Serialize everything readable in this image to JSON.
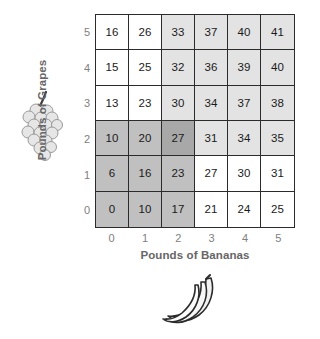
{
  "chart_data": {
    "type": "heatmap",
    "title": "",
    "xlabel": "Pounds of Bananas",
    "ylabel": "Pounds of Grapes",
    "x_ticks": [
      "0",
      "1",
      "2",
      "3",
      "4",
      "5"
    ],
    "y_ticks": [
      "5",
      "4",
      "3",
      "2",
      "1",
      "0"
    ],
    "x_values": [
      0,
      1,
      2,
      3,
      4,
      5
    ],
    "y_values": [
      0,
      1,
      2,
      3,
      4,
      5
    ],
    "grid": true,
    "legend": "none",
    "note": "Total-utility table: rows are Pounds of Grapes (5 at top down to 0 at bottom), columns are Pounds of Bananas (0 to 5 left to right). Cells are shaded in three gray levels plus white.",
    "rows": [
      {
        "y_label": "5",
        "cells": [
          {
            "value": "16",
            "shade": "white"
          },
          {
            "value": "26",
            "shade": "white"
          },
          {
            "value": "33",
            "shade": "light"
          },
          {
            "value": "37",
            "shade": "light"
          },
          {
            "value": "40",
            "shade": "light"
          },
          {
            "value": "41",
            "shade": "light"
          }
        ]
      },
      {
        "y_label": "4",
        "cells": [
          {
            "value": "15",
            "shade": "white"
          },
          {
            "value": "25",
            "shade": "white"
          },
          {
            "value": "32",
            "shade": "light"
          },
          {
            "value": "36",
            "shade": "light"
          },
          {
            "value": "39",
            "shade": "light"
          },
          {
            "value": "40",
            "shade": "light"
          }
        ]
      },
      {
        "y_label": "3",
        "cells": [
          {
            "value": "13",
            "shade": "white"
          },
          {
            "value": "23",
            "shade": "white"
          },
          {
            "value": "30",
            "shade": "light"
          },
          {
            "value": "34",
            "shade": "light"
          },
          {
            "value": "37",
            "shade": "light"
          },
          {
            "value": "38",
            "shade": "light"
          }
        ]
      },
      {
        "y_label": "2",
        "cells": [
          {
            "value": "10",
            "shade": "medium"
          },
          {
            "value": "20",
            "shade": "medium"
          },
          {
            "value": "27",
            "shade": "dark"
          },
          {
            "value": "31",
            "shade": "light"
          },
          {
            "value": "34",
            "shade": "light"
          },
          {
            "value": "35",
            "shade": "light"
          }
        ]
      },
      {
        "y_label": "1",
        "cells": [
          {
            "value": "6",
            "shade": "medium"
          },
          {
            "value": "16",
            "shade": "medium"
          },
          {
            "value": "23",
            "shade": "medium"
          },
          {
            "value": "27",
            "shade": "white"
          },
          {
            "value": "30",
            "shade": "white"
          },
          {
            "value": "31",
            "shade": "white"
          }
        ]
      },
      {
        "y_label": "0",
        "cells": [
          {
            "value": "0",
            "shade": "medium"
          },
          {
            "value": "10",
            "shade": "medium"
          },
          {
            "value": "17",
            "shade": "medium"
          },
          {
            "value": "21",
            "shade": "white"
          },
          {
            "value": "24",
            "shade": "white"
          },
          {
            "value": "25",
            "shade": "white"
          }
        ]
      }
    ],
    "shade_colors": {
      "white": "#ffffff",
      "light": "#e3e3e3",
      "medium": "#c0c0c0",
      "dark": "#a8a8a8"
    },
    "axis_label_color": "#666666",
    "tick_label_color": "#808080",
    "grid_line_color": "#2b2b2b",
    "cell_text_color": "#1a1a1a"
  },
  "illustrations": {
    "grapes": "grapes-icon",
    "bananas": "bananas-icon"
  }
}
